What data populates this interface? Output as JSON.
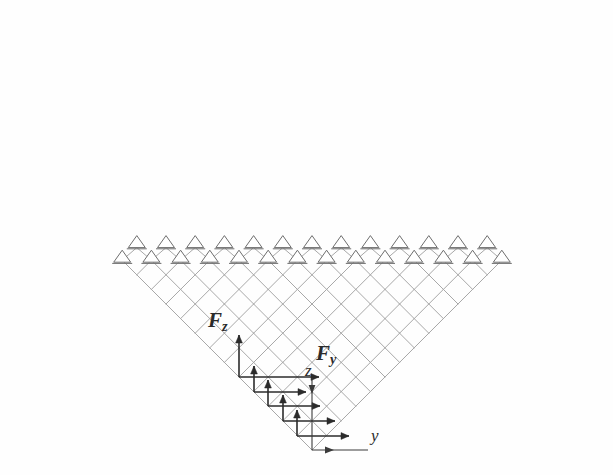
{
  "figure": {
    "background_color": "#fefefe",
    "lattice_color": "#a8a8a8",
    "support_color": "#6e6e6e",
    "arrow_color": "#2b2b2b",
    "axis_color": "#3a3a3a"
  },
  "labels": {
    "force_z": "F",
    "force_z_sub": "z",
    "force_y": "F",
    "force_y_sub": "y",
    "axis_z": "z",
    "axis_y": "y"
  },
  "geometry": {
    "apex_x": 312,
    "apex_y": 450,
    "top_y": 60,
    "cell_half_width": 14.6,
    "cell_half_height": 14.6,
    "rows": 13,
    "top_span_left_x": 33,
    "top_span_right_x": 576
  },
  "supports": {
    "symbol": "pin-triangle",
    "upper_row_count": 19,
    "lower_row_count": 20,
    "upper_row_y": 45,
    "lower_row_y": 60
  },
  "loads": {
    "count": 5,
    "vertical_label": "Fz",
    "horizontal_label": "Fy",
    "nodes": [
      {
        "x": 239,
        "y": 377
      },
      {
        "x": 254,
        "y": 392
      },
      {
        "x": 268,
        "y": 406
      },
      {
        "x": 283,
        "y": 421
      },
      {
        "x": 297,
        "y": 436
      }
    ]
  },
  "axes": {
    "y_axis": {
      "label": "y",
      "from_x": 312,
      "from_y": 450,
      "to_x": 368,
      "to_y": 450
    },
    "z_axis": {
      "label": "z",
      "from_x": 312,
      "from_y": 378,
      "to_x": 312,
      "to_y": 450
    }
  },
  "chart_data": {
    "type": "diagram",
    "xlabel": "y",
    "ylabel": "z"
  }
}
